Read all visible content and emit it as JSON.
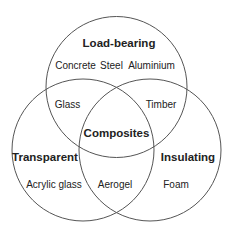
{
  "diagram": {
    "type": "venn",
    "sets": [
      {
        "id": "load_bearing",
        "label": "Load-bearing"
      },
      {
        "id": "transparent",
        "label": "Transparent"
      },
      {
        "id": "insulating",
        "label": "Insulating"
      }
    ],
    "center": {
      "label": "Composites",
      "sets": [
        "load_bearing",
        "transparent",
        "insulating"
      ]
    },
    "regions": {
      "load_bearing_only": [
        "Concrete",
        "Steel",
        "Aluminium"
      ],
      "load_bearing_transparent": [
        "Glass"
      ],
      "load_bearing_insulating": [
        "Timber"
      ],
      "transparent_only": [
        "Acrylic glass"
      ],
      "transparent_insulating": [
        "Aerogel"
      ],
      "insulating_only": [
        "Foam"
      ]
    },
    "colors": {
      "stroke": "#555555",
      "text": "#222222",
      "background": "#ffffff"
    }
  }
}
